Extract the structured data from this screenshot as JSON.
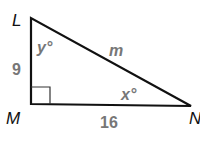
{
  "diagram": {
    "type": "right-triangle",
    "vertices": {
      "top": "L",
      "right_angle": "M",
      "right": "N"
    },
    "sides": {
      "LM": "9",
      "MN": "16",
      "LN": "m"
    },
    "angles": {
      "at_L": "y°",
      "at_N": "x°",
      "at_M": "right-angle"
    },
    "colors": {
      "lines": "#111111",
      "labels": "#777777"
    }
  }
}
